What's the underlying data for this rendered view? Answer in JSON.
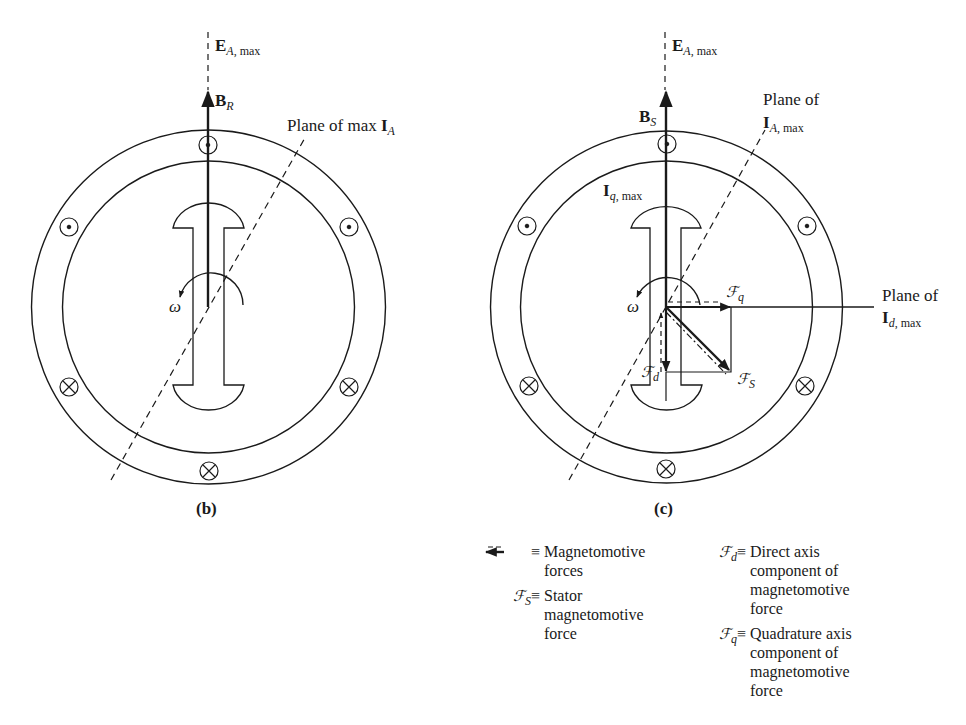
{
  "colors": {
    "ink": "#1a1a1a",
    "background": "#ffffff"
  },
  "diagram_b": {
    "caption": "(b)",
    "e_label": {
      "main": "E",
      "sub_italic": "A",
      "sub_rest": ", max"
    },
    "b_label": {
      "main": "B",
      "sub_italic": "R"
    },
    "plane_label": {
      "text": "Plane of max ",
      "main": "I",
      "sub_italic": "A"
    },
    "omega": "ω",
    "conductors": [
      "dot",
      "dot",
      "dot",
      "cross",
      "cross",
      "cross"
    ]
  },
  "diagram_c": {
    "caption": "(c)",
    "e_label": {
      "main": "E",
      "sub_italic": "A",
      "sub_rest": ", max"
    },
    "b_label": {
      "main": "B",
      "sub_italic": "S"
    },
    "iq_label": {
      "main": "I",
      "sub_italic": "q",
      "sub_rest": ", max"
    },
    "plane_ia_label": {
      "line1": "Plane of",
      "main": "I",
      "sub_italic": "A",
      "sub_rest": ", max"
    },
    "plane_id_label": {
      "line1": "Plane of",
      "main": "I",
      "sub_italic": "d",
      "sub_rest": ", max"
    },
    "fq_label": {
      "main": "ℱ",
      "sub": "q"
    },
    "fd_label": {
      "main": "ℱ",
      "sub": "d"
    },
    "fs_label": {
      "main": "ℱ",
      "sub": "S"
    },
    "omega": "ω",
    "conductors": [
      "dot",
      "dot",
      "dot",
      "cross",
      "cross",
      "cross"
    ]
  },
  "legend": {
    "items": [
      {
        "symbol": "⇐ ≡",
        "symbol_name": "arrow-legend",
        "lines": [
          "Magnetomotive",
          "forces"
        ]
      },
      {
        "symbol_main": "ℱ",
        "symbol_sub": "S",
        "equiv": "≡",
        "lines": [
          "Stator",
          "magnetomotive",
          "force"
        ]
      },
      {
        "symbol_main": "ℱ",
        "symbol_sub": "d",
        "equiv": "≡",
        "lines": [
          "Direct axis",
          "component of",
          "magnetomotive",
          "force"
        ]
      },
      {
        "symbol_main": "ℱ",
        "symbol_sub": "q",
        "equiv": "≡",
        "lines": [
          "Quadrature axis",
          "component of",
          "magnetomotive",
          "force"
        ]
      }
    ]
  }
}
